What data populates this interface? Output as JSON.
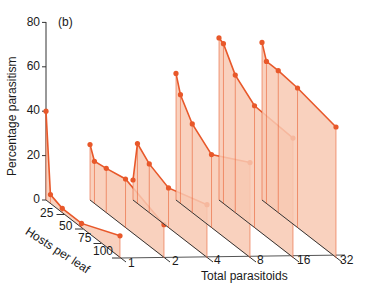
{
  "chart_data": {
    "type": "area",
    "subtype": "3d-stacked-profiles",
    "panel_label": "(b)",
    "title": "",
    "ylabel": "Percentage parasitism",
    "xlabel": "Total parasitoids",
    "zlabel": "Hosts per leaf",
    "ylim": [
      0,
      80
    ],
    "y_ticks": [
      "0",
      "20",
      "40",
      "60",
      "80"
    ],
    "x_categories": [
      "1",
      "2",
      "4",
      "8",
      "16",
      "32"
    ],
    "z_ticks": [
      "25",
      "50",
      "75",
      "100"
    ],
    "hosts_positions": [
      0,
      6,
      22,
      48,
      100
    ],
    "series": [
      {
        "name": "1",
        "values": [
          40,
          4,
          2,
          2,
          10
        ]
      },
      {
        "name": "2",
        "values": [
          25,
          19,
          20,
          22,
          15
        ]
      },
      {
        "name": "4",
        "values": [
          9,
          27,
          22,
          18,
          24
        ]
      },
      {
        "name": "8",
        "values": [
          57,
          49,
          40,
          33,
          43
        ]
      },
      {
        "name": "16",
        "values": [
          73,
          72,
          62,
          55,
          54
        ]
      },
      {
        "name": "32",
        "values": [
          71,
          64,
          64,
          63,
          59
        ]
      }
    ],
    "colors": {
      "line": "#e8582a",
      "fill": "#f8c9b3",
      "axis": "#333333"
    },
    "grid": false,
    "legend": "none"
  }
}
